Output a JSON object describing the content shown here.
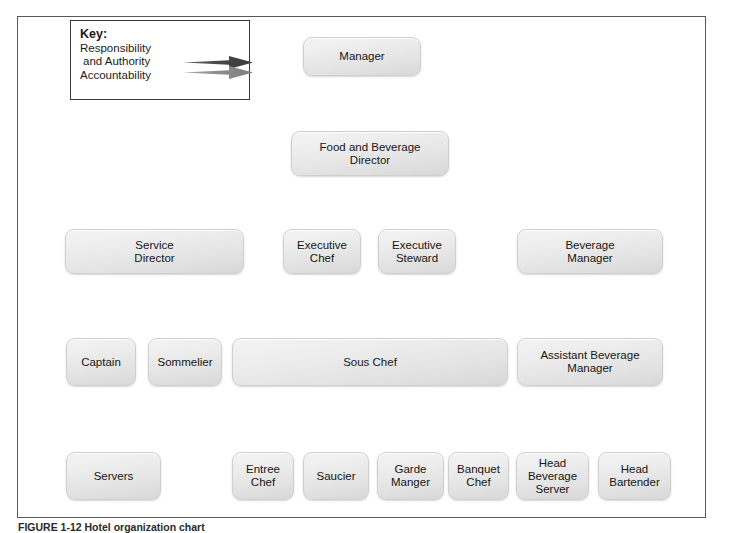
{
  "figure": {
    "caption": "FIGURE 1-12  Hotel organization chart"
  },
  "key": {
    "title": "Key:",
    "entries": [
      {
        "label": "Responsibility\nand Authority",
        "arrow": "solid-dark-arrow",
        "color": "#4a4a4a"
      },
      {
        "label": "Accountability",
        "arrow": "solid-gray-arrow",
        "color": "#8e8e8e"
      }
    ],
    "responsibility_label_line1": "Responsibility",
    "responsibility_label_line2": "and Authority",
    "accountability_label": "Accountability"
  },
  "colors": {
    "responsibility_arrow": "#4a4a4a",
    "accountability_arrow": "#8e8e8e",
    "box_fill_light": "#f3f3f3",
    "box_fill_dark": "#d8d8d8",
    "frame_border": "#5a5a5a"
  },
  "nodes": [
    {
      "id": "manager",
      "label": "Manager",
      "lines": [
        "Manager"
      ]
    },
    {
      "id": "fb_director",
      "label": "Food and Beverage Director",
      "lines": [
        "Food and Beverage",
        "Director"
      ]
    },
    {
      "id": "service_director",
      "label": "Service Director",
      "lines": [
        "Service",
        "Director"
      ]
    },
    {
      "id": "executive_chef",
      "label": "Executive Chef",
      "lines": [
        "Executive",
        "Chef"
      ]
    },
    {
      "id": "executive_steward",
      "label": "Executive Steward",
      "lines": [
        "Executive",
        "Steward"
      ]
    },
    {
      "id": "beverage_manager",
      "label": "Beverage Manager",
      "lines": [
        "Beverage",
        "Manager"
      ]
    },
    {
      "id": "captain",
      "label": "Captain",
      "lines": [
        "Captain"
      ]
    },
    {
      "id": "sommelier",
      "label": "Sommelier",
      "lines": [
        "Sommelier"
      ]
    },
    {
      "id": "sous_chef",
      "label": "Sous Chef",
      "lines": [
        "Sous Chef"
      ]
    },
    {
      "id": "asst_bev_manager",
      "label": "Assistant Beverage Manager",
      "lines": [
        "Assistant Beverage",
        "Manager"
      ]
    },
    {
      "id": "servers",
      "label": "Servers",
      "lines": [
        "Servers"
      ]
    },
    {
      "id": "entree_chef",
      "label": "Entree Chef",
      "lines": [
        "Entree",
        "Chef"
      ]
    },
    {
      "id": "saucier",
      "label": "Saucier",
      "lines": [
        "Saucier"
      ]
    },
    {
      "id": "garde_manger",
      "label": "Garde Manger",
      "lines": [
        "Garde",
        "Manger"
      ]
    },
    {
      "id": "banquet_chef",
      "label": "Banquet Chef",
      "lines": [
        "Banquet",
        "Chef"
      ]
    },
    {
      "id": "head_bev_server",
      "label": "Head Beverage Server",
      "lines": [
        "Head",
        "Beverage",
        "Server"
      ]
    },
    {
      "id": "head_bartender",
      "label": "Head Bartender",
      "lines": [
        "Head",
        "Bartender"
      ]
    }
  ],
  "edges": [
    {
      "from": "manager",
      "to": "fb_director",
      "types": [
        "responsibility",
        "accountability"
      ]
    },
    {
      "from": "fb_director",
      "to": "service_director",
      "types": [
        "responsibility",
        "accountability"
      ]
    },
    {
      "from": "fb_director",
      "to": "executive_chef",
      "types": [
        "responsibility",
        "accountability"
      ]
    },
    {
      "from": "fb_director",
      "to": "executive_steward",
      "types": [
        "responsibility",
        "accountability"
      ]
    },
    {
      "from": "fb_director",
      "to": "beverage_manager",
      "types": [
        "responsibility",
        "accountability"
      ]
    },
    {
      "from": "service_director",
      "to": "captain",
      "types": [
        "responsibility",
        "accountability"
      ]
    },
    {
      "from": "service_director",
      "to": "sommelier",
      "types": [
        "responsibility",
        "accountability"
      ]
    },
    {
      "from": "executive_chef",
      "to": "sous_chef",
      "types": [
        "responsibility",
        "accountability"
      ]
    },
    {
      "from": "beverage_manager",
      "to": "asst_bev_manager",
      "types": [
        "responsibility",
        "accountability"
      ]
    },
    {
      "from": "captain",
      "to": "servers",
      "types": [
        "responsibility",
        "accountability"
      ]
    },
    {
      "from": "sous_chef",
      "to": "entree_chef",
      "types": [
        "responsibility",
        "accountability"
      ]
    },
    {
      "from": "sous_chef",
      "to": "saucier",
      "types": [
        "responsibility",
        "accountability"
      ]
    },
    {
      "from": "sous_chef",
      "to": "garde_manger",
      "types": [
        "responsibility",
        "accountability"
      ]
    },
    {
      "from": "sous_chef",
      "to": "banquet_chef",
      "types": [
        "responsibility",
        "accountability"
      ]
    },
    {
      "from": "asst_bev_manager",
      "to": "head_bev_server",
      "types": [
        "responsibility",
        "accountability"
      ]
    },
    {
      "from": "asst_bev_manager",
      "to": "head_bartender",
      "types": [
        "responsibility",
        "accountability"
      ]
    }
  ]
}
